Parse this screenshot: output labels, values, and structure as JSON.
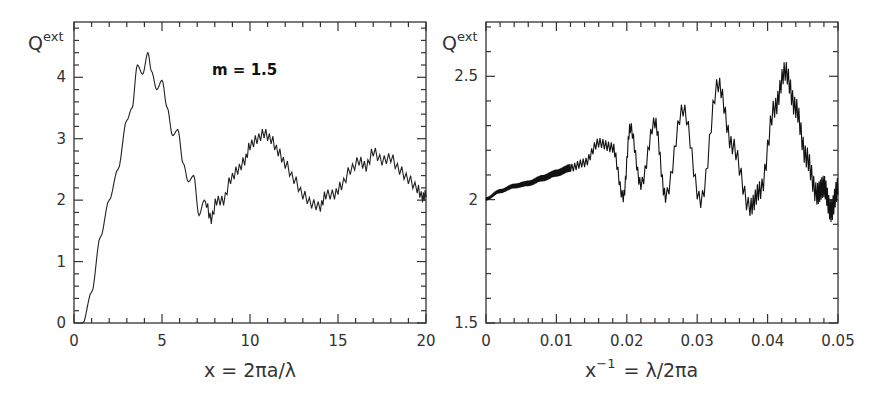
{
  "chart_data": [
    {
      "type": "line",
      "title": "",
      "annotation": "m = 1.5",
      "xlabel": "x = 2πa/λ",
      "ylabel": "Q",
      "ylabel_sup": "ext",
      "xlim": [
        0,
        20
      ],
      "ylim": [
        0,
        4.9
      ],
      "xticks": [
        0,
        5,
        10,
        15,
        20
      ],
      "xtick_labels": [
        "0",
        "5",
        "10",
        "15",
        "20"
      ],
      "yticks": [
        0,
        1,
        2,
        3,
        4
      ],
      "ytick_labels": [
        "0",
        "1",
        "2",
        "3",
        "4"
      ],
      "grid": false,
      "series": [
        {
          "name": "Q_ext (m=1.5)",
          "x": [
            0.5,
            1.0,
            1.5,
            2.0,
            2.5,
            3.0,
            3.3,
            3.6,
            3.9,
            4.2,
            4.4,
            4.7,
            5.0,
            5.3,
            5.6,
            5.9,
            6.2,
            6.5,
            6.8,
            7.1,
            7.4,
            7.8,
            8.1,
            8.5,
            8.9,
            9.3,
            9.7,
            10.0,
            10.4,
            10.8,
            11.2,
            11.6,
            12.0,
            12.5,
            13.0,
            13.5,
            14.0,
            14.3,
            14.8,
            15.2,
            15.7,
            16.2,
            16.6,
            17.0,
            17.5,
            18.0,
            18.5,
            19.0,
            19.5,
            19.8,
            20.0
          ],
          "y": [
            0.0,
            0.5,
            1.4,
            2.0,
            2.5,
            3.3,
            3.5,
            4.2,
            4.05,
            4.4,
            4.1,
            3.8,
            3.95,
            3.5,
            3.05,
            3.15,
            2.6,
            2.3,
            2.4,
            1.75,
            2.0,
            1.65,
            1.95,
            1.95,
            2.3,
            2.45,
            2.6,
            2.85,
            2.95,
            3.05,
            2.95,
            2.75,
            2.55,
            2.3,
            2.05,
            1.9,
            1.85,
            2.05,
            2.05,
            2.2,
            2.45,
            2.6,
            2.5,
            2.75,
            2.6,
            2.65,
            2.45,
            2.3,
            2.15,
            2.0,
            2.05
          ]
        }
      ]
    },
    {
      "type": "line",
      "title": "",
      "xlabel": "x⁻¹ = λ/2πa",
      "ylabel": "Q",
      "ylabel_sup": "ext",
      "xlim": [
        0,
        0.05
      ],
      "ylim": [
        1.5,
        2.72
      ],
      "xticks": [
        0,
        0.01,
        0.02,
        0.03,
        0.04,
        0.05
      ],
      "xtick_labels": [
        "0",
        "0.01",
        "0.02",
        "0.03",
        "0.04",
        "0.05"
      ],
      "yticks": [
        1.5,
        2,
        2.5
      ],
      "ytick_labels": [
        "1.5",
        "2",
        "2.5"
      ],
      "grid": false,
      "series": [
        {
          "name": "Q_ext vs 1/x",
          "x": [
            0.0,
            0.002,
            0.004,
            0.006,
            0.008,
            0.01,
            0.012,
            0.014,
            0.016,
            0.018,
            0.0195,
            0.0205,
            0.022,
            0.024,
            0.0255,
            0.028,
            0.0305,
            0.033,
            0.035,
            0.0375,
            0.039,
            0.041,
            0.0425,
            0.044,
            0.0455,
            0.047,
            0.048,
            0.049,
            0.05
          ],
          "y": [
            2.0,
            2.03,
            2.05,
            2.06,
            2.08,
            2.1,
            2.12,
            2.14,
            2.22,
            2.2,
            2.0,
            2.28,
            2.05,
            2.3,
            2.0,
            2.35,
            1.98,
            2.45,
            2.2,
            1.95,
            2.02,
            2.35,
            2.5,
            2.35,
            2.15,
            2.0,
            2.03,
            1.93,
            2.02
          ]
        }
      ]
    }
  ],
  "panels": {
    "left": {
      "ylabel": "Q",
      "ylabel_sup": "ext",
      "annotation": "m = 1.5",
      "xlabel": "x = 2πa/λ"
    },
    "right": {
      "ylabel": "Q",
      "ylabel_sup": "ext",
      "xlabel_main": "x",
      "xlabel_sup": "−1",
      "xlabel_rest": "= λ/2πa"
    }
  }
}
